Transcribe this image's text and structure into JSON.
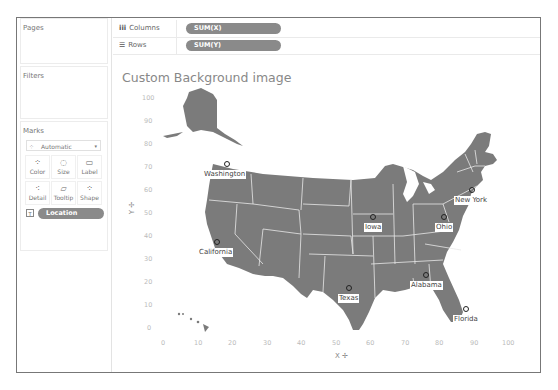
{
  "left_panel": {
    "pages_title": "Pages",
    "filters_title": "Filters",
    "marks": {
      "title": "Marks",
      "mark_type": "Automatic",
      "buttons": [
        {
          "label": "Color",
          "icon": "color-dots-icon"
        },
        {
          "label": "Size",
          "icon": "size-icon"
        },
        {
          "label": "Label",
          "icon": "label-icon"
        },
        {
          "label": "Detail",
          "icon": "detail-icon"
        },
        {
          "label": "Tooltip",
          "icon": "tooltip-icon"
        },
        {
          "label": "Shape",
          "icon": "shape-icon"
        }
      ],
      "field_pill": "Location"
    }
  },
  "shelves": {
    "columns": {
      "label": "Columns",
      "pill": "SUM(X)"
    },
    "rows": {
      "label": "Rows",
      "pill": "SUM(Y)"
    }
  },
  "viz": {
    "title": "Custom Background image",
    "x_axis_label": "X",
    "y_axis_label": "Y",
    "x_ticks": [
      "0",
      "10",
      "20",
      "30",
      "40",
      "50",
      "60",
      "70",
      "80",
      "90",
      "100"
    ],
    "y_ticks": [
      "100",
      "90",
      "80",
      "70",
      "60",
      "50",
      "40",
      "30",
      "20",
      "10",
      "0"
    ],
    "map_color": "#7b7b7b",
    "points": [
      {
        "name": "Washington",
        "x": 18.5,
        "y": 72
      },
      {
        "name": "California",
        "x": 15.7,
        "y": 38
      },
      {
        "name": "Iowa",
        "x": 61,
        "y": 49
      },
      {
        "name": "Ohio",
        "x": 81.5,
        "y": 49
      },
      {
        "name": "New York",
        "x": 89.6,
        "y": 60.6
      },
      {
        "name": "Texas",
        "x": 54,
        "y": 18
      },
      {
        "name": "Alabama",
        "x": 76,
        "y": 24
      },
      {
        "name": "Florida",
        "x": 88,
        "y": 9
      }
    ]
  }
}
